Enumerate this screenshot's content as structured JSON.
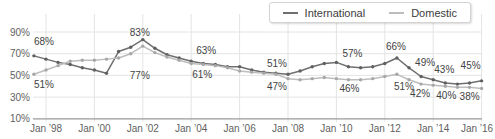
{
  "legend": {
    "items": [
      {
        "label": "International",
        "color": "#6f6f6f"
      },
      {
        "label": "Domestic",
        "color": "#bdbdbd"
      }
    ]
  },
  "colors": {
    "background": "#ffffff",
    "grid": "#e4e4e4",
    "axis_line": "#9a9a9a",
    "axis_text": "#5f5f5f",
    "label_text": "#434343",
    "legend_border": "#d4d4d4"
  },
  "chart_data": {
    "type": "line",
    "title": "",
    "xlabel": "",
    "ylabel": "",
    "grid": true,
    "legend_position": "top-right",
    "ylim": [
      10,
      90
    ],
    "x": [
      1997.5,
      1998,
      1998.5,
      1999,
      1999.5,
      2000,
      2000.5,
      2001,
      2001.5,
      2002,
      2002.5,
      2003,
      2003.5,
      2004,
      2004.5,
      2005,
      2005.5,
      2006,
      2006.5,
      2007,
      2007.5,
      2008,
      2008.5,
      2009,
      2009.5,
      2010,
      2010.5,
      2011,
      2011.5,
      2012,
      2012.5,
      2013,
      2013.5,
      2014,
      2014.5,
      2015,
      2015.5,
      2016
    ],
    "x_ticks": [
      {
        "year": 1998,
        "label": "Jan ’98"
      },
      {
        "year": 2000,
        "label": "Jan ’00"
      },
      {
        "year": 2002,
        "label": "Jan ’02"
      },
      {
        "year": 2004,
        "label": "Jan ’04"
      },
      {
        "year": 2006,
        "label": "Jan ’06"
      },
      {
        "year": 2008,
        "label": "Jan ’08"
      },
      {
        "year": 2010,
        "label": "Jan ’10"
      },
      {
        "year": 2012,
        "label": "Jan ’12"
      },
      {
        "year": 2014,
        "label": "Jan ’14"
      },
      {
        "year": 2016,
        "label": "Jan ’16"
      }
    ],
    "y_ticks": [
      {
        "value": 90,
        "label": "90%"
      },
      {
        "value": 70,
        "label": "70%"
      },
      {
        "value": 50,
        "label": "50%"
      },
      {
        "value": 30,
        "label": "30%"
      },
      {
        "value": 10,
        "label": "10%"
      }
    ],
    "series": [
      {
        "name": "International",
        "color": "#6f6f6f",
        "dot_color": "#606060",
        "values": [
          68,
          65,
          62,
          60,
          57,
          55,
          52,
          72,
          76,
          83,
          75,
          69,
          66,
          63,
          61,
          60,
          58,
          58,
          55,
          53,
          52,
          51,
          54,
          58,
          61,
          62,
          58,
          57,
          58,
          61,
          66,
          57,
          49,
          46,
          43,
          42,
          43,
          45
        ],
        "labels": [
          {
            "text": "68%",
            "year": 1997.5,
            "value": 68,
            "dx": 10,
            "dy": -14
          },
          {
            "text": "83%",
            "year": 2002,
            "value": 83,
            "dx": -3,
            "dy": -7
          },
          {
            "text": "63%",
            "year": 2004,
            "value": 63,
            "dx": 15,
            "dy": -11
          },
          {
            "text": "51%",
            "year": 2008,
            "value": 51,
            "dx": -11,
            "dy": -11
          },
          {
            "text": "57%",
            "year": 2010.5,
            "value": 58,
            "dx": 4,
            "dy": -13
          },
          {
            "text": "66%",
            "year": 2012.5,
            "value": 66,
            "dx": -1,
            "dy": -12
          },
          {
            "text": "49%",
            "year": 2013.5,
            "value": 49,
            "dx": 4,
            "dy": -14
          },
          {
            "text": "43%",
            "year": 2014.5,
            "value": 43,
            "dx": -1,
            "dy": -13
          },
          {
            "text": "45%",
            "year": 2016,
            "value": 45,
            "dx": -11,
            "dy": -15
          }
        ]
      },
      {
        "name": "Domestic",
        "color": "#bdbdbd",
        "dot_color": "#a8a8a8",
        "values": [
          51,
          55,
          59,
          63,
          64,
          64,
          65,
          66,
          70,
          77,
          71,
          67,
          64,
          61,
          60,
          59,
          57,
          54,
          53,
          52,
          51,
          47,
          46,
          47,
          48,
          47,
          46,
          46,
          47,
          49,
          51,
          46,
          42,
          41,
          40,
          39,
          39,
          38
        ],
        "labels": [
          {
            "text": "51%",
            "year": 1997.5,
            "value": 51,
            "dx": 10,
            "dy": 10
          },
          {
            "text": "77%",
            "year": 2002,
            "value": 77,
            "dx": -3,
            "dy": 29
          },
          {
            "text": "61%",
            "year": 2004,
            "value": 61,
            "dx": 11,
            "dy": 11
          },
          {
            "text": "47%",
            "year": 2008,
            "value": 47,
            "dx": -11,
            "dy": 8
          },
          {
            "text": "46%",
            "year": 2010.5,
            "value": 46,
            "dx": 1,
            "dy": 9
          },
          {
            "text": "51%",
            "year": 2012.5,
            "value": 51,
            "dx": 7,
            "dy": 12
          },
          {
            "text": "42%",
            "year": 2013.5,
            "value": 42,
            "dx": -1,
            "dy": 9
          },
          {
            "text": "40%",
            "year": 2014.5,
            "value": 40,
            "dx": 1,
            "dy": 9
          },
          {
            "text": "38%",
            "year": 2016,
            "value": 38,
            "dx": -12,
            "dy": 8
          }
        ]
      }
    ]
  }
}
